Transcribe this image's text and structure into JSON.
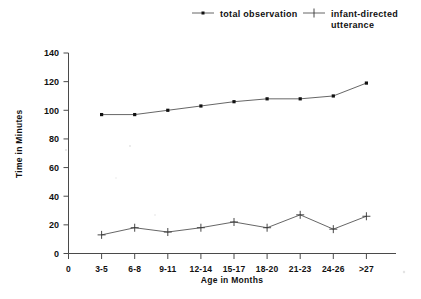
{
  "chart_data": {
    "type": "line",
    "title": "",
    "xlabel": "Age in Months",
    "ylabel": "Time in Minutes",
    "categories": [
      "3-5",
      "6-8",
      "9-11",
      "12-14",
      "15-17",
      "18-20",
      "21-23",
      "24-26",
      ">27"
    ],
    "x_tick_labels": [
      "0",
      "3-5",
      "6-8",
      "9-11",
      "12-14",
      "15-17",
      "18-20",
      "21-23",
      "24-26",
      ">27"
    ],
    "y_tick_labels": [
      "0",
      "20",
      "40",
      "60",
      "80",
      "100",
      "120",
      "140"
    ],
    "y_ticks": [
      0,
      20,
      40,
      60,
      80,
      100,
      120,
      140
    ],
    "ylim": [
      0,
      140
    ],
    "grid": false,
    "legend_position": "top",
    "series": [
      {
        "name": "total observation",
        "marker": "square",
        "values": [
          97,
          97,
          100,
          103,
          106,
          108,
          108,
          110,
          119
        ]
      },
      {
        "name": "infant-directed utterance",
        "marker": "plus",
        "values": [
          13,
          18,
          15,
          18,
          22,
          18,
          27,
          17,
          26
        ]
      }
    ]
  },
  "legend": {
    "items": [
      {
        "label": "total observation",
        "label_line2": ""
      },
      {
        "label": "infant-directed",
        "label_line2": "utterance"
      }
    ]
  },
  "axes": {
    "y_title": "Time in Minutes",
    "x_title": "Age in Months"
  },
  "colors": {
    "series_line": "#555555",
    "marker": "#111111",
    "axis": "#4a4a4a",
    "text": "#111111",
    "background": "#ffffff"
  }
}
